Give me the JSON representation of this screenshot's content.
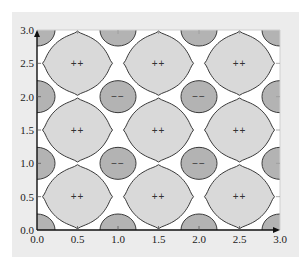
{
  "chart_data": {
    "type": "contour",
    "title": "",
    "xlabel": "",
    "ylabel": "",
    "xlim": [
      0.0,
      3.0
    ],
    "ylim": [
      0.0,
      3.0
    ],
    "x_ticks": [
      "0.0",
      "0.5",
      "1.0",
      "1.5",
      "2.0",
      "2.5",
      "3.0"
    ],
    "y_ticks": [
      "0.0",
      "0.5",
      "1.0",
      "1.5",
      "2.0",
      "2.5",
      "3.0"
    ],
    "grid": false,
    "legend": null,
    "colors": {
      "positive_fill": "#d9d9d9",
      "negative_fill": "#b3b3b3",
      "outline": "#3a3a3a",
      "plot_background": "#ffffff",
      "panel_background": "#ececec"
    },
    "positive_regions": {
      "label": "++",
      "shape": "rounded-diamond",
      "centers": [
        [
          0.5,
          0.5
        ],
        [
          1.5,
          0.5
        ],
        [
          2.5,
          0.5
        ],
        [
          0.5,
          1.5
        ],
        [
          1.5,
          1.5
        ],
        [
          2.5,
          1.5
        ],
        [
          0.5,
          2.5
        ],
        [
          1.5,
          2.5
        ],
        [
          2.5,
          2.5
        ]
      ]
    },
    "negative_regions": {
      "label": "−−",
      "shape": "ellipse",
      "labeled_centers": [
        [
          1.0,
          1.0
        ],
        [
          2.0,
          1.0
        ],
        [
          1.0,
          2.0
        ],
        [
          2.0,
          2.0
        ]
      ],
      "edge_centers": [
        [
          0.0,
          0.0
        ],
        [
          1.0,
          0.0
        ],
        [
          2.0,
          0.0
        ],
        [
          3.0,
          0.0
        ],
        [
          0.0,
          1.0
        ],
        [
          3.0,
          1.0
        ],
        [
          0.0,
          2.0
        ],
        [
          3.0,
          2.0
        ],
        [
          0.0,
          3.0
        ],
        [
          1.0,
          3.0
        ],
        [
          2.0,
          3.0
        ],
        [
          3.0,
          3.0
        ]
      ]
    }
  }
}
